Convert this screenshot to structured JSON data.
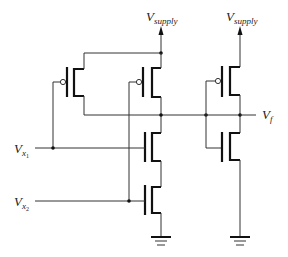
{
  "diagram": {
    "type": "cmos-circuit-schematic",
    "labels": {
      "supply_left": {
        "main": "V",
        "sub": "supply"
      },
      "supply_right": {
        "main": "V",
        "sub": "supply"
      },
      "input_1": {
        "main": "V",
        "sub": "x",
        "subsub": "1"
      },
      "input_2": {
        "main": "V",
        "sub": "x",
        "subsub": "2"
      },
      "output": {
        "main": "V",
        "sub": "f"
      }
    },
    "components": [
      {
        "id": "P1",
        "kind": "pmos",
        "gate": "V_x1"
      },
      {
        "id": "P2",
        "kind": "pmos",
        "gate": "V_x2"
      },
      {
        "id": "N1",
        "kind": "nmos",
        "gate": "V_x1"
      },
      {
        "id": "N2",
        "kind": "nmos",
        "gate": "V_x2"
      },
      {
        "id": "P3",
        "kind": "pmos",
        "gate": "nand_out"
      },
      {
        "id": "N3",
        "kind": "nmos",
        "gate": "nand_out"
      },
      {
        "id": "GND1",
        "kind": "ground"
      },
      {
        "id": "GND2",
        "kind": "ground"
      }
    ],
    "colors": {
      "wire": "#333333",
      "background": "#ffffff"
    }
  }
}
